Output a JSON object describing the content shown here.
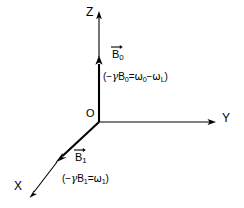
{
  "figure": {
    "type": "3d-axes-vector-diagram",
    "background_color": "#ffffff",
    "line_color": "#000000",
    "origin_label": "O",
    "axes": [
      {
        "name": "x-axis",
        "label": "X",
        "direction": "down-left"
      },
      {
        "name": "y-axis",
        "label": "Y",
        "direction": "right"
      },
      {
        "name": "z-axis",
        "label": "Z",
        "direction": "up"
      }
    ],
    "vectors": [
      {
        "name": "b0",
        "symbol_base": "B",
        "symbol_sub": "0",
        "along_axis": "z",
        "formula_open": "(",
        "formula_minus": "−",
        "formula_gamma": "γ",
        "formula_b": "B",
        "formula_b_sub": "0",
        "formula_eq": "=",
        "formula_omega1": "ω",
        "formula_omega1_sub": "0",
        "formula_op": "−",
        "formula_omega2": "ω",
        "formula_omega2_sub": "L",
        "formula_close": ")"
      },
      {
        "name": "b1",
        "symbol_base": "B",
        "symbol_sub": "1",
        "along_axis": "x",
        "formula_open": "(",
        "formula_minus": "−",
        "formula_gamma": "γ",
        "formula_b": "B",
        "formula_b_sub": "1",
        "formula_eq": "=",
        "formula_omega1": "ω",
        "formula_omega1_sub": "1",
        "formula_close": ")"
      }
    ]
  }
}
